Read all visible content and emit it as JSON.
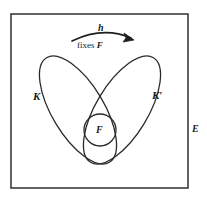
{
  "figure": {
    "outer_box": {
      "name": "ambient-field-box",
      "label": "E",
      "x": 11,
      "y": 14,
      "width": 177,
      "height": 174,
      "stroke": "#3c3c3c",
      "stroke_width": 1.6,
      "fill": "#ffffff"
    },
    "labels": {
      "left_ellipse": "K",
      "right_ellipse": "K′",
      "inner_circle": "F",
      "outer_box": "E",
      "map": "h",
      "map_caption_plain": "fixes ",
      "map_caption_italic": "F"
    },
    "arrow": {
      "name": "h-map-arrow",
      "label_above": "h",
      "label_below": "fixes F",
      "start_x": 72,
      "start_y": 41,
      "end_x": 134,
      "end_y": 40,
      "apex_y": 31,
      "stroke": "#1f1f1f"
    },
    "shapes": [
      {
        "name": "left-ellipse-K",
        "label": "K",
        "cx": 78,
        "cy": 110,
        "rx": 26,
        "ry": 61,
        "rotation_deg": -31,
        "stroke": "#2a2a2a",
        "stroke_width": 1.3,
        "fill": "none"
      },
      {
        "name": "right-ellipse-K-prime",
        "label": "K′",
        "cx": 122,
        "cy": 110,
        "rx": 26,
        "ry": 61,
        "rotation_deg": 31,
        "stroke": "#2a2a2a",
        "stroke_width": 1.3,
        "fill": "none"
      },
      {
        "name": "inner-circle-F",
        "label": "F",
        "cx": 100,
        "cy": 130,
        "r": 16,
        "stroke": "#2a2a2a",
        "stroke_width": 1.3,
        "fill": "none"
      }
    ],
    "colors": {
      "ink": "#2a2a2a",
      "box_stroke": "#3c3c3c",
      "background": "#ffffff",
      "text": "#1a1a1a"
    }
  }
}
